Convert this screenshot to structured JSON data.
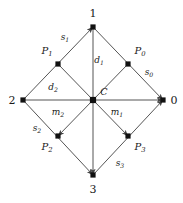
{
  "figure": {
    "width": 183,
    "height": 203,
    "background": "#ffffff",
    "line_color": "#555555",
    "node_color": "#111111",
    "text_color": "#1a1a1a"
  },
  "vertices": [
    {
      "id": "v1",
      "label": "1",
      "x": 93,
      "y": 27,
      "label_x": 93,
      "label_y": 13
    },
    {
      "id": "v2",
      "label": "2",
      "x": 23,
      "y": 100,
      "label_x": 12,
      "label_y": 100
    },
    {
      "id": "v0",
      "label": "0",
      "x": 163,
      "y": 100,
      "label_x": 174,
      "label_y": 100
    },
    {
      "id": "v3",
      "label": "3",
      "x": 93,
      "y": 175,
      "label_x": 93,
      "label_y": 189
    }
  ],
  "midpoints": [
    {
      "id": "P1",
      "base": "P",
      "sub": "1",
      "x": 58,
      "y": 64,
      "label_x": 47,
      "label_y": 52
    },
    {
      "id": "P0",
      "base": "P",
      "sub": "0",
      "x": 128,
      "y": 64,
      "label_x": 140,
      "label_y": 52
    },
    {
      "id": "P2",
      "base": "P",
      "sub": "2",
      "x": 58,
      "y": 136,
      "label_x": 47,
      "label_y": 148
    },
    {
      "id": "P3",
      "base": "P",
      "sub": "3",
      "x": 128,
      "y": 136,
      "label_x": 140,
      "label_y": 148
    }
  ],
  "center": {
    "id": "C",
    "label": "C",
    "x": 93,
    "y": 100,
    "label_x": 104,
    "label_y": 92
  },
  "edge_labels": [
    {
      "id": "s1",
      "base": "s",
      "sub": "1",
      "x": 65,
      "y": 38
    },
    {
      "id": "s0",
      "base": "s",
      "sub": "0",
      "x": 149,
      "y": 73
    },
    {
      "id": "s2",
      "base": "s",
      "sub": "2",
      "x": 37,
      "y": 129
    },
    {
      "id": "s3",
      "base": "s",
      "sub": "3",
      "x": 120,
      "y": 164
    },
    {
      "id": "d1",
      "base": "d",
      "sub": "1",
      "x": 99,
      "y": 61
    },
    {
      "id": "d2",
      "base": "d",
      "sub": "2",
      "x": 53,
      "y": 88
    },
    {
      "id": "m2",
      "base": "m",
      "sub": "2",
      "x": 58,
      "y": 113
    },
    {
      "id": "m1",
      "base": "m",
      "sub": "1",
      "x": 117,
      "y": 113
    }
  ],
  "segments": [
    {
      "id": "seg-2-to-1",
      "from": "v2",
      "to": "v1",
      "arrow": "end"
    },
    {
      "id": "seg-1-to-0",
      "from": "v1",
      "to": "v0",
      "arrow": "end"
    },
    {
      "id": "seg-2-to-3",
      "from": "v2",
      "to": "v3",
      "arrow": "end"
    },
    {
      "id": "seg-3-to-0",
      "from": "v3",
      "to": "v0",
      "arrow": "end"
    },
    {
      "id": "seg-2-to-0",
      "from": "v2",
      "to": "v0",
      "arrow": "end"
    },
    {
      "id": "seg-1-to-3",
      "from": "v1",
      "to": "v3",
      "arrow": "end"
    },
    {
      "id": "seg-P1-to-P3",
      "from": "P1",
      "to": "P3",
      "arrow": "end"
    },
    {
      "id": "seg-P0-to-P2",
      "from": "P0",
      "to": "P2",
      "arrow": "end"
    }
  ]
}
